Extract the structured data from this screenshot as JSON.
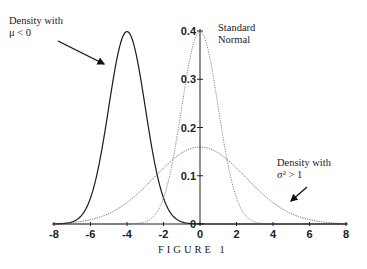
{
  "chart_data": {
    "type": "line",
    "title": "",
    "caption": "FIGURE 1",
    "xlabel": "",
    "ylabel": "",
    "xlim": [
      -8,
      8
    ],
    "ylim": [
      0,
      0.4
    ],
    "x_ticks": [
      -8,
      -6,
      -4,
      -2,
      0,
      2,
      4,
      6,
      8
    ],
    "x_tick_labels": [
      "-8",
      "-6",
      "-4",
      "-2",
      "0",
      "2",
      "4",
      "6",
      "8"
    ],
    "y_ticks": [
      0,
      0.1,
      0.2,
      0.3,
      0.4
    ],
    "y_tick_labels": [
      "0",
      "0.1",
      "0.2",
      "0.3",
      "0.4"
    ],
    "grid": false,
    "legend": "none (inline annotations)",
    "series": [
      {
        "name": "Density with μ < 0",
        "distribution": "normal",
        "mean": -4,
        "sd": 1,
        "peak": 0.4,
        "style": "solid",
        "color": "#1a1a1a"
      },
      {
        "name": "Standard Normal",
        "distribution": "normal",
        "mean": 0,
        "sd": 1,
        "peak": 0.4,
        "style": "dotted",
        "color": "#777777"
      },
      {
        "name": "Density with σ² > 1",
        "distribution": "normal",
        "mean": 0,
        "sd": 2.5,
        "peak": 0.16,
        "style": "dotted",
        "color": "#555555"
      }
    ],
    "annotations": [
      {
        "line1": "Density with",
        "line2": "μ  < 0",
        "arrow_to": [
          -5.2,
          0.33
        ]
      },
      {
        "line1": "Standard",
        "line2": "Normal"
      },
      {
        "line1": "Density with",
        "line2": "σ² > 1",
        "arrow_to": [
          4.9,
          0.05
        ]
      }
    ]
  },
  "labels": {
    "mu_line1": "Density with",
    "mu_line2": "μ  < 0",
    "std_line1": "Standard",
    "std_line2": "Normal",
    "sigma_line1": "Density with",
    "sigma_line2": "σ² > 1",
    "caption": "FIGURE 1"
  }
}
